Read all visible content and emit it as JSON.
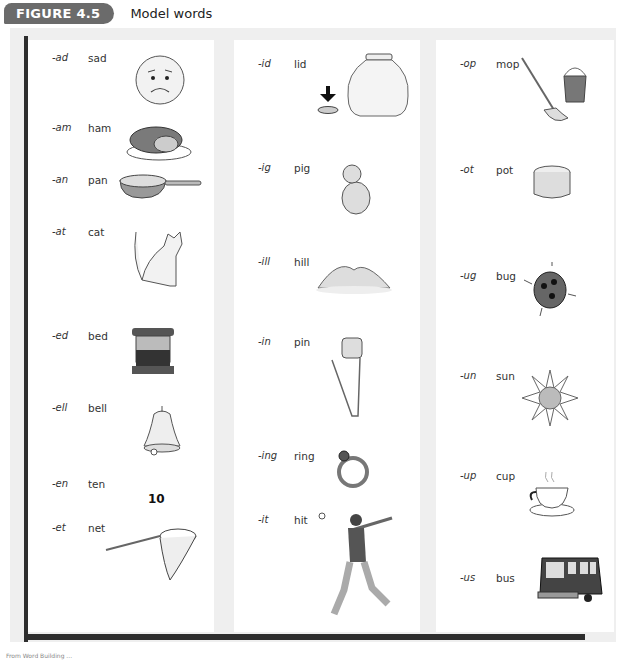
{
  "header": {
    "badge": "FIGURE 4.5",
    "title": "Model words"
  },
  "columns": [
    {
      "entries": [
        {
          "rime": "-ad",
          "word": "sad",
          "picture": "sad-face-icon"
        },
        {
          "rime": "-am",
          "word": "ham",
          "picture": "ham-icon"
        },
        {
          "rime": "-an",
          "word": "pan",
          "picture": "frying-pan-icon"
        },
        {
          "rime": "-at",
          "word": "cat",
          "picture": "cat-icon"
        },
        {
          "rime": "-ed",
          "word": "bed",
          "picture": "bed-icon"
        },
        {
          "rime": "-ell",
          "word": "bell",
          "picture": "bell-icon"
        },
        {
          "rime": "-en",
          "word": "ten",
          "picture": "number-ten",
          "picture_text": "10"
        },
        {
          "rime": "-et",
          "word": "net",
          "picture": "net-icon"
        }
      ]
    },
    {
      "entries": [
        {
          "rime": "-id",
          "word": "lid",
          "picture": "jar-lid-icon"
        },
        {
          "rime": "-ig",
          "word": "pig",
          "picture": "pig-icon"
        },
        {
          "rime": "-ill",
          "word": "hill",
          "picture": "hill-icon"
        },
        {
          "rime": "-in",
          "word": "pin",
          "picture": "safety-pin-icon"
        },
        {
          "rime": "-ing",
          "word": "ring",
          "picture": "ring-icon"
        },
        {
          "rime": "-it",
          "word": "hit",
          "picture": "batter-icon"
        }
      ]
    },
    {
      "entries": [
        {
          "rime": "-op",
          "word": "mop",
          "picture": "mop-icon"
        },
        {
          "rime": "-ot",
          "word": "pot",
          "picture": "pot-icon"
        },
        {
          "rime": "-ug",
          "word": "bug",
          "picture": "ladybug-icon"
        },
        {
          "rime": "-un",
          "word": "sun",
          "picture": "sun-icon"
        },
        {
          "rime": "-up",
          "word": "cup",
          "picture": "teacup-icon"
        },
        {
          "rime": "-us",
          "word": "bus",
          "picture": "bus-icon"
        }
      ]
    }
  ],
  "caption": "From Word Building ..."
}
